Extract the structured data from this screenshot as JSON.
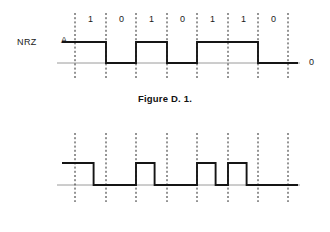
{
  "page": {
    "background_color": "#ffffff",
    "text_color": "#1a1a1a"
  },
  "figures": [
    {
      "id": "figure-1",
      "signal_name": "NRZ",
      "amplitude_label": "A",
      "zero_label": "0",
      "caption": "Figure D. 1.",
      "bits": [
        "1",
        "0",
        "1",
        "0",
        "1",
        "1",
        "0"
      ],
      "encoding": "NRZ"
    },
    {
      "id": "figure-2",
      "signal_name": "RZ",
      "amplitude_label": "A",
      "zero_label": "0",
      "caption": "Figure D. 2.",
      "bits": [
        "1",
        "0",
        "1",
        "0",
        "1",
        "1",
        "0"
      ],
      "encoding": "RZ"
    }
  ],
  "chart_data": {
    "type": "line",
    "xlabel": "",
    "ylabel": "",
    "grid": "vertical dashed bit-period boundaries",
    "legend": "none",
    "levels": {
      "high": "A",
      "low": "0"
    },
    "bit_sequence": [
      "1",
      "0",
      "1",
      "0",
      "1",
      "1",
      "0"
    ],
    "series": [
      {
        "name": "NRZ",
        "description": "Level held high for the whole bit period when the bit is 1, low when the bit is 0",
        "duty_cycle_for_one": 1.0,
        "values": [
          1,
          0,
          1,
          0,
          1,
          1,
          0
        ]
      },
      {
        "name": "RZ",
        "description": "Pulse returns to zero within the bit period; a 1 is high for the first ~60% of the bit period then drops to zero",
        "duty_cycle_for_one": 0.6,
        "values": [
          1,
          0,
          1,
          0,
          1,
          1,
          0
        ]
      }
    ],
    "axis": {
      "x_bit_boundaries_px": [
        75,
        106,
        136,
        167,
        197,
        228,
        258,
        288
      ],
      "bit_period_px": 30.4,
      "y_high_px": 42,
      "y_zero_px": 63
    }
  }
}
